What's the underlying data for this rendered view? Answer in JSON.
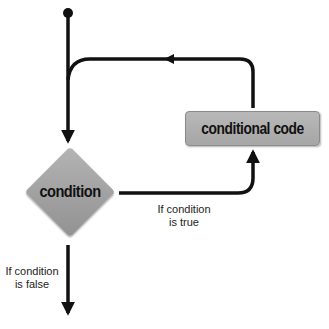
{
  "diagram": {
    "type": "flowchart",
    "title": "",
    "nodes": {
      "start": {
        "shape": "dot"
      },
      "condition": {
        "shape": "diamond",
        "label": "condition"
      },
      "conditional_code": {
        "shape": "rounded-rectangle",
        "label": "conditional code"
      }
    },
    "edges": {
      "true_branch": {
        "from": "condition",
        "to": "conditional_code",
        "label_line1": "If condition",
        "label_line2": "is true"
      },
      "false_branch": {
        "from": "condition",
        "to": "exit",
        "label_line1": "If condition",
        "label_line2": "is false"
      },
      "loop_back": {
        "from": "conditional_code",
        "to": "main_line",
        "label": ""
      },
      "entry": {
        "from": "start",
        "to": "condition",
        "label": ""
      }
    }
  },
  "colors": {
    "background": "#ffffff",
    "line": "#111111",
    "node_fill": "#a8a8a8",
    "node_border": "#8a8a8a",
    "text": "#111111",
    "label_text": "#222222"
  }
}
